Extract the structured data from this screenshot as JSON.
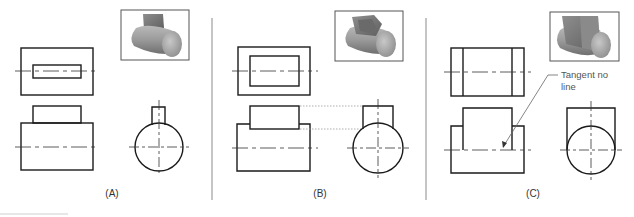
{
  "figure": {
    "panels": [
      {
        "id": "A",
        "caption": "(A)"
      },
      {
        "id": "B",
        "caption": "(B)"
      },
      {
        "id": "C",
        "caption": "(C)",
        "annotation": {
          "line1": "Tangent no",
          "line2": "line"
        }
      }
    ]
  },
  "colors": {
    "line": "#1a1a1a",
    "divider": "#8a8a8a",
    "centerline": "#333333",
    "hidden": "#999999",
    "shade_light": "#d8d8d8",
    "shade_dark": "#7a7a7a"
  }
}
